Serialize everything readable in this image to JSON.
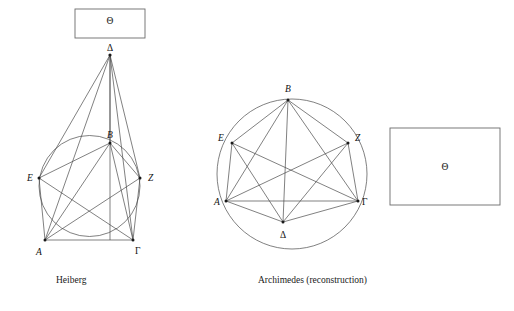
{
  "figure": {
    "title_visible": false,
    "background_color": "#ffffff",
    "line_color": "#4a4a4a",
    "box_line_color": "#6a6a6a",
    "label_color": "#111111"
  },
  "panels": [
    {
      "id": "heiberg",
      "caption": "Heiberg",
      "box_label": "Θ",
      "vertices": [
        {
          "key": "delta",
          "label": "Δ",
          "x": 110,
          "y": 55
        },
        {
          "key": "beta",
          "label": "B",
          "x": 110,
          "y": 143
        },
        {
          "key": "epsilon",
          "label": "E",
          "x": 39,
          "y": 178
        },
        {
          "key": "zeta",
          "label": "Z",
          "x": 140,
          "y": 178
        },
        {
          "key": "alpha",
          "label": "A",
          "x": 45,
          "y": 240
        },
        {
          "key": "gamma",
          "label": "Γ",
          "x": 133,
          "y": 240
        }
      ]
    },
    {
      "id": "archimedes",
      "caption": "Archimedes (reconstruction)",
      "box_label": "Θ",
      "vertices": [
        {
          "key": "beta",
          "label": "B",
          "x": 288,
          "y": 100
        },
        {
          "key": "epsilon",
          "label": "E",
          "x": 232,
          "y": 143
        },
        {
          "key": "zeta",
          "label": "Z",
          "x": 348,
          "y": 143
        },
        {
          "key": "alpha",
          "label": "A",
          "x": 226,
          "y": 201
        },
        {
          "key": "gamma",
          "label": "Γ",
          "x": 358,
          "y": 201
        },
        {
          "key": "delta",
          "label": "Δ",
          "x": 283,
          "y": 222
        }
      ]
    }
  ],
  "labels": {
    "theta_left": "Θ",
    "theta_right": "Θ",
    "delta_left": "Δ",
    "beta_left": "B",
    "epsilon_left": "E",
    "zeta_left": "Z",
    "alpha_left": "A",
    "gamma_left": "Γ",
    "beta_right": "B",
    "epsilon_right": "E",
    "zeta_right": "Z",
    "alpha_right": "A",
    "gamma_right": "Γ",
    "delta_right": "Δ"
  },
  "captions": {
    "left": "Heiberg",
    "right": "Archimedes (reconstruction)"
  }
}
